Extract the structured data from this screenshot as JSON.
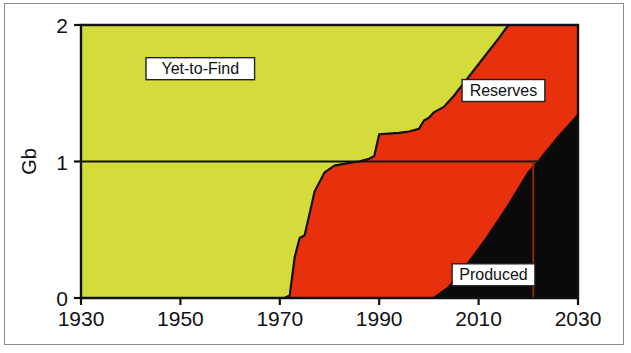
{
  "figure": {
    "frame_border_color": "#8b8b8b",
    "background": "#ffffff"
  },
  "chart_data": {
    "type": "area",
    "stacked": true,
    "title": "",
    "subtitle": "",
    "xlabel": "",
    "ylabel": "Gb",
    "xlim": [
      1930,
      2030
    ],
    "ylim": [
      0,
      2
    ],
    "xticks": [
      1930,
      1950,
      1970,
      1990,
      2010,
      2030
    ],
    "xtick_labels": [
      "1930",
      "1950",
      "1970",
      "1990",
      "2010",
      "2030"
    ],
    "yticks": [
      0,
      1,
      2
    ],
    "ytick_labels": [
      "0",
      "1",
      "2"
    ],
    "grid": false,
    "legend_position": "inline-annotations",
    "annotations": [
      {
        "text": "Yet-to-Find",
        "x": 1954,
        "y": 1.68,
        "color": "#111111"
      },
      {
        "text": "Reserves",
        "x": 2015,
        "y": 1.52,
        "color": "#111111"
      },
      {
        "text": "Produced",
        "x": 2013,
        "y": 0.17,
        "color": "#111111"
      }
    ],
    "reference_lines": [
      {
        "name": "one-gb-line",
        "orientation": "horizontal",
        "value": 1,
        "x_from": 1930,
        "x_to": 2022,
        "color": "#111111"
      },
      {
        "name": "year-2020-line",
        "orientation": "vertical",
        "value": 2021,
        "y_from": 0,
        "y_to": 1.0,
        "color": "#8a2a10"
      }
    ],
    "series": [
      {
        "name": "Produced",
        "color": "#0a0a0a",
        "order": 1,
        "points": [
          [
            1930,
            0.0
          ],
          [
            1960,
            0.0
          ],
          [
            1975,
            0.0
          ],
          [
            1990,
            0.0
          ],
          [
            1998,
            0.0
          ],
          [
            2001,
            0.0
          ],
          [
            2004,
            0.08
          ],
          [
            2008,
            0.26
          ],
          [
            2012,
            0.46
          ],
          [
            2016,
            0.68
          ],
          [
            2020,
            0.92
          ],
          [
            2022,
            1.0
          ],
          [
            2026,
            1.18
          ],
          [
            2030,
            1.34
          ]
        ]
      },
      {
        "name": "Reserves",
        "color": "#e8300c",
        "order": 2,
        "cumulative_top_points": [
          [
            1930,
            0.0
          ],
          [
            1968,
            0.0
          ],
          [
            1971,
            0.0
          ],
          [
            1972,
            0.02
          ],
          [
            1973,
            0.3
          ],
          [
            1974,
            0.44
          ],
          [
            1975,
            0.46
          ],
          [
            1976,
            0.62
          ],
          [
            1977,
            0.78
          ],
          [
            1979,
            0.92
          ],
          [
            1981,
            0.97
          ],
          [
            1984,
            0.99
          ],
          [
            1986,
            1.0
          ],
          [
            1987,
            1.01
          ],
          [
            1988,
            1.02
          ],
          [
            1989,
            1.04
          ],
          [
            1990,
            1.2
          ],
          [
            1994,
            1.21
          ],
          [
            1996,
            1.22
          ],
          [
            1998,
            1.24
          ],
          [
            1999,
            1.3
          ],
          [
            2000,
            1.32
          ],
          [
            2001,
            1.36
          ],
          [
            2002,
            1.38
          ],
          [
            2003,
            1.4
          ],
          [
            2005,
            1.48
          ],
          [
            2008,
            1.62
          ],
          [
            2011,
            1.76
          ],
          [
            2014,
            1.9
          ],
          [
            2016,
            2.0
          ],
          [
            2030,
            2.0
          ]
        ]
      },
      {
        "name": "Yet-to-Find",
        "color": "#d4dc3c",
        "order": 3,
        "top_value": 2.0
      }
    ],
    "total_top": 2.0
  }
}
